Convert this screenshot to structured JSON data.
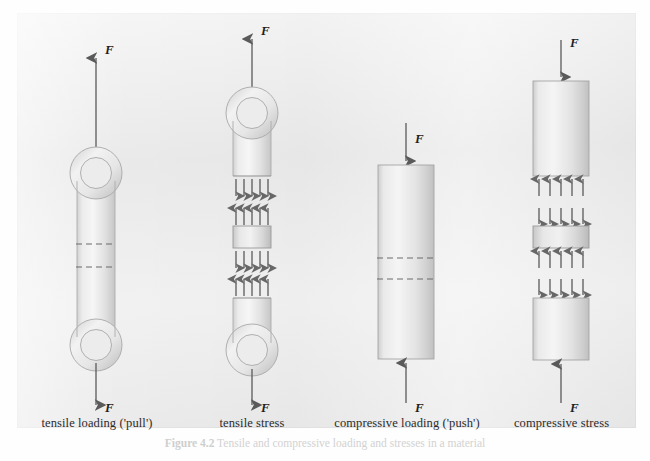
{
  "figure": {
    "caption_number": "Figure 4.2",
    "caption_text": "Tensile and compressive loading and stresses in a material",
    "panel_color": "#ececec",
    "member_fill_light": "#f3f3f3",
    "member_fill_dark": "#c9c9c9",
    "arrow_color": "#5a5a5a",
    "outline_color": "#9a9a9a"
  },
  "panels": [
    {
      "id": "tensile-loading",
      "label": "tensile loading ('pull')",
      "top_force_label": "F",
      "bottom_force_label": "F",
      "top_force_direction": "up",
      "bottom_force_direction": "down",
      "shape": "eyelet-bar",
      "dashed_lines": 2,
      "stress_arrows": "none"
    },
    {
      "id": "tensile-stress",
      "label": "tensile stress",
      "top_force_label": "F",
      "bottom_force_label": "F",
      "top_force_direction": "up",
      "bottom_force_direction": "down",
      "shape": "eyelet-bar-split",
      "dashed_lines": 0,
      "stress_arrows": "outward",
      "arrows_per_row": 5,
      "arrow_rows": 4
    },
    {
      "id": "compressive-loading",
      "label": "compressive loading ('push')",
      "top_force_label": "F",
      "bottom_force_label": "F",
      "top_force_direction": "down",
      "bottom_force_direction": "up",
      "shape": "column",
      "dashed_lines": 2,
      "stress_arrows": "none"
    },
    {
      "id": "compressive-stress",
      "label": "compressive stress",
      "top_force_label": "F",
      "bottom_force_label": "F",
      "top_force_direction": "down",
      "bottom_force_direction": "up",
      "shape": "column-split",
      "dashed_lines": 0,
      "stress_arrows": "inward",
      "arrows_per_row": 5,
      "arrow_rows": 4
    }
  ]
}
